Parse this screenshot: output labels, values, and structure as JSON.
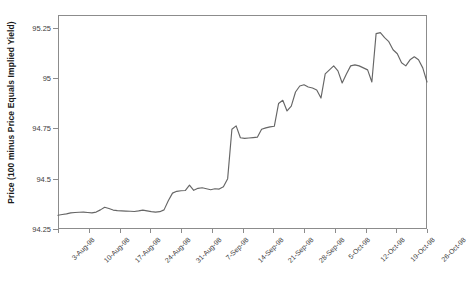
{
  "chart_data": {
    "type": "line",
    "title": "",
    "xlabel": "",
    "ylabel": "Price (100 minus Price Equals Implied Yield)",
    "ylim": [
      94.25,
      95.3125
    ],
    "yticks": [
      94.25,
      94.5,
      94.75,
      95,
      95.25
    ],
    "ytick_labels": [
      "94.25",
      "94.5",
      "94.75",
      "95",
      "95.25"
    ],
    "grid": false,
    "legend": "none",
    "line_color": "#666666",
    "x_tick_labels": [
      "3-Aug-98",
      "10-Aug-98",
      "17-Aug-98",
      "24-Aug-98",
      "31-Aug-98",
      "7-Sep-98",
      "14-Sep-98",
      "21-Sep-98",
      "28-Sep-98",
      "5-Oct-98",
      "12-Oct-98",
      "19-Oct-98",
      "26-Oct-98"
    ],
    "x_start_label": "3-Aug-98",
    "x_end_label": "26-Oct-98",
    "x_tick_spacing_days": 7,
    "series": [
      {
        "name": "Price",
        "values": [
          94.318,
          94.322,
          94.325,
          94.33,
          94.332,
          94.333,
          94.334,
          94.332,
          94.33,
          94.334,
          94.345,
          94.358,
          94.352,
          94.344,
          94.341,
          94.34,
          94.339,
          94.338,
          94.337,
          94.34,
          94.344,
          94.34,
          94.336,
          94.334,
          94.336,
          94.345,
          94.39,
          94.428,
          94.437,
          94.44,
          94.441,
          94.468,
          94.442,
          94.452,
          94.455,
          94.45,
          94.445,
          94.45,
          94.448,
          94.46,
          94.5,
          94.745,
          94.762,
          94.703,
          94.7,
          94.702,
          94.704,
          94.706,
          94.745,
          94.752,
          94.757,
          94.76,
          94.873,
          94.889,
          94.836,
          94.86,
          94.93,
          94.96,
          94.966,
          94.955,
          94.95,
          94.94,
          94.9,
          95.02,
          95.04,
          95.06,
          95.035,
          94.975,
          95.02,
          95.06,
          95.065,
          95.06,
          95.05,
          95.04,
          94.98,
          95.22,
          95.225,
          95.2,
          95.18,
          95.14,
          95.12,
          95.075,
          95.06,
          95.09,
          95.105,
          95.09,
          95.05,
          94.98
        ]
      }
    ]
  }
}
